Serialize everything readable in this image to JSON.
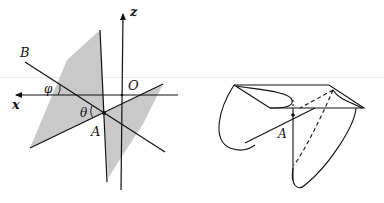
{
  "figure": {
    "left_panel": {
      "labels": {
        "z_axis": "z",
        "x_axis": "x",
        "origin": "O",
        "point_a": "A",
        "point_b": "B",
        "angle_phi": "φ",
        "angle_theta": "θ"
      }
    },
    "right_panel": {
      "labels": {
        "point_a": "A"
      }
    },
    "colors": {
      "stroke": "#111111",
      "plane_fill": "#c8c8c8",
      "background": "#ffffff"
    }
  }
}
